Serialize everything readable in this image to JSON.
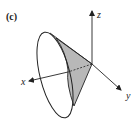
{
  "figure": {
    "panel_label": "(c)",
    "axes": {
      "x_label": "x",
      "y_label": "y",
      "z_label": "z"
    },
    "colors": {
      "stroke": "#222222",
      "shade": "#b8b8b8",
      "background": "#ffffff"
    }
  }
}
